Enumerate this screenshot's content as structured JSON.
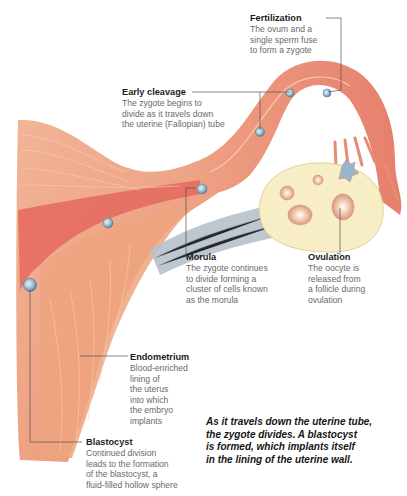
{
  "figure": {
    "type": "anatomical-illustration",
    "colors": {
      "uterine_wall": "#e99a7b",
      "uterine_wall_light": "#f3c0a6",
      "lumen_red": "#e0605a",
      "ovary": "#f7ecc2",
      "ligament": "#a9b4c0",
      "cell": "#8fb3c9",
      "leader_line": "#555555"
    }
  },
  "labels": {
    "fertilization": {
      "title": "Fertilization",
      "desc": "The ovum and a\nsingle sperm fuse\nto form a zygote"
    },
    "early_cleavage": {
      "title": "Early cleavage",
      "desc": "The zygote begins to\ndivide as it travels down\nthe uterine (Fallopian) tube"
    },
    "morula": {
      "title": "Morula",
      "desc": "The zygote continues\nto divide forming a\ncluster of cells known\nas the morula"
    },
    "ovulation": {
      "title": "Ovulation",
      "desc": "The oocyte is\nreleased from\na follicle during\novulation"
    },
    "endometrium": {
      "title": "Endometrium",
      "desc": "Blood-enriched\nlining of\nthe uterus\ninto which\nthe embryo\nimplants"
    },
    "blastocyst": {
      "title": "Blastocyst",
      "desc": "Continued division\nleads to the formation\nof the blastocyst, a\nfluid-filled hollow sphere"
    }
  },
  "caption": "As it travels down the uterine tube,\nthe zygote divides. A blastocyst\nis formed, which implants itself\nin the lining of the uterine wall."
}
